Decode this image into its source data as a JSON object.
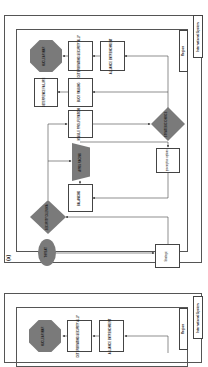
{
  "panel_a": {
    "tag": "(a)",
    "outer_label": "International System",
    "inner_label": "Region",
    "nodes": {
      "nuclear_war": "NUCLEAR WAR",
      "deteriorating": "DETERIORATING SECURITY ALLY",
      "alliance": "ALLIANCE ENTRENCHMENT",
      "deterrence": "DETERRENCE FAILURE",
      "buck_passing": "BUCK PASSING",
      "missile": "MISSILE PROLIFERATION",
      "arms_racing": "ARMS RACING",
      "balancing": "BALANCING",
      "decision_right": "STRATEGIC CHOICE",
      "preemptive": "preemptive options",
      "decision_left": "SECURITY DILEMMA",
      "start": "THREAT",
      "strategic": "Strategic"
    }
  },
  "panel_b": {
    "outer_label": "International System",
    "inner_label": "Region",
    "nodes": {
      "nuclear_war": "NUCLEAR WAR",
      "deteriorating": "DETERIORATING SECURITY ALLY",
      "alliance": "ALLIANCE ENTRENCHMENT"
    }
  },
  "colors": {
    "shape_fill": "#7a7a7a",
    "line": "#444444",
    "background": "#ffffff"
  }
}
